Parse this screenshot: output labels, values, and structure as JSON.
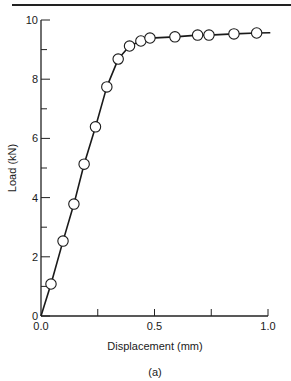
{
  "chart_data": {
    "type": "line",
    "title": "",
    "caption": "(a)",
    "xlabel": "Displacement (mm)",
    "ylabel": "Load (kN)",
    "xlim": [
      0.0,
      1.0
    ],
    "ylim": [
      0,
      10
    ],
    "grid": false,
    "legend": null,
    "x_ticks": [
      {
        "value": 0.0,
        "label": "0.0"
      },
      {
        "value": 0.25,
        "label": ""
      },
      {
        "value": 0.5,
        "label": "0.5"
      },
      {
        "value": 0.75,
        "label": ""
      },
      {
        "value": 1.0,
        "label": "1.0"
      }
    ],
    "y_ticks": [
      {
        "value": 0,
        "label": "0"
      },
      {
        "value": 1,
        "label": ""
      },
      {
        "value": 2,
        "label": "2"
      },
      {
        "value": 3,
        "label": ""
      },
      {
        "value": 4,
        "label": "4"
      },
      {
        "value": 5,
        "label": ""
      },
      {
        "value": 6,
        "label": "6"
      },
      {
        "value": 7,
        "label": ""
      },
      {
        "value": 8,
        "label": "8"
      },
      {
        "value": 9,
        "label": ""
      },
      {
        "value": 10,
        "label": "10"
      }
    ],
    "series": [
      {
        "name": "Load-displacement",
        "marker": "open-circle",
        "line": "solid",
        "x": [
          0.044,
          0.097,
          0.145,
          0.19,
          0.24,
          0.29,
          0.34,
          0.39,
          0.44,
          0.48,
          0.59,
          0.69,
          0.74,
          0.85,
          0.95
        ],
        "y": [
          1.08,
          2.53,
          3.78,
          5.13,
          6.39,
          7.74,
          8.68,
          9.12,
          9.29,
          9.39,
          9.43,
          9.49,
          9.49,
          9.53,
          9.56
        ]
      }
    ],
    "curve_start": [
      0.0,
      0.0
    ],
    "curve_end": [
      1.01,
      9.57
    ]
  }
}
